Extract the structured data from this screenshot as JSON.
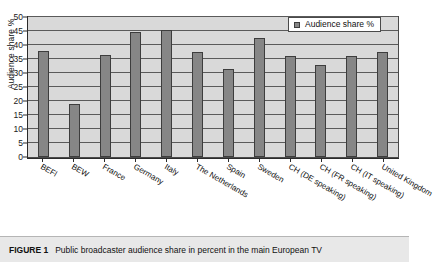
{
  "figure": {
    "caption_label": "FIGURE 1",
    "caption_text": "Public broadcaster audience share in percent in the main European TV"
  },
  "legend": {
    "entries": [
      {
        "label": "Audience share %",
        "color": "#868686"
      }
    ]
  },
  "axis": {
    "y_title": "Audience share %",
    "y_ticks": [
      "0",
      "5",
      "10",
      "15",
      "20",
      "25",
      "30",
      "35",
      "40",
      "45",
      "50"
    ]
  },
  "chart_data": {
    "type": "bar",
    "title": "Public broadcaster audience share in percent in the main European TV",
    "xlabel": "",
    "ylabel": "Audience share %",
    "ylim": [
      0,
      50
    ],
    "ytick_step": 5,
    "grid": true,
    "legend_position": "top-right",
    "series_name": "Audience share %",
    "bar_color": "#868686",
    "categories": [
      "BEFl",
      "BEW",
      "France",
      "Germany",
      "Italy",
      "The Netherlands",
      "Spain",
      "Sweden",
      "CH (DE speaking)",
      "CH (FR speaking)",
      "CH (IT speaking)",
      "United Kingdom"
    ],
    "values": [
      37.8,
      19.0,
      36.5,
      44.5,
      45.2,
      37.5,
      31.5,
      42.5,
      36.0,
      33.0,
      36.0,
      37.5
    ]
  }
}
